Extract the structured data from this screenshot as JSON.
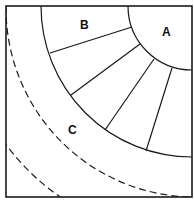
{
  "diagram": {
    "type": "quarter-circle zone diagram",
    "labels": {
      "a": "A",
      "b": "B",
      "c": "C"
    },
    "colors": {
      "line": "#1a1a1a",
      "background": "#ffffff"
    },
    "regions": [
      {
        "id": "A",
        "description": "inner quarter-circle at top-right corner"
      },
      {
        "id": "B",
        "description": "ring segmented by radial lines into 5 cells"
      },
      {
        "id": "C",
        "description": "outer band bounded by dashed arc"
      }
    ],
    "radial_divider_count": 4,
    "dashed_arc_count": 3
  }
}
